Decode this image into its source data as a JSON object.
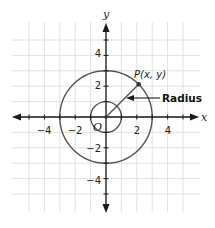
{
  "diagram": {
    "axes": {
      "x_label": "x",
      "y_label": "y",
      "origin_label": "O",
      "x_tick_labels": [
        {
          "value": -4,
          "text": "−4"
        },
        {
          "value": -2,
          "text": "−2"
        },
        {
          "value": 2,
          "text": "2"
        },
        {
          "value": 4,
          "text": "4"
        }
      ],
      "y_tick_labels": [
        {
          "value": 4,
          "text": "4"
        },
        {
          "value": 2,
          "text": "2"
        },
        {
          "value": -2,
          "text": "−2"
        },
        {
          "value": -4,
          "text": "−4"
        }
      ],
      "range": [
        -5,
        5
      ]
    },
    "circles": [
      {
        "name": "unit-circle",
        "radius": 1
      },
      {
        "name": "large-circle",
        "radius": 3
      }
    ],
    "point": {
      "label": "P(x, y)",
      "angle_deg": 45,
      "radius": 3
    },
    "annotation": {
      "label": "Radius"
    },
    "colors": {
      "grid": "#e2e2e2",
      "axis": "#1a1a1a",
      "circle": "#555555",
      "background": "#ffffff"
    }
  }
}
